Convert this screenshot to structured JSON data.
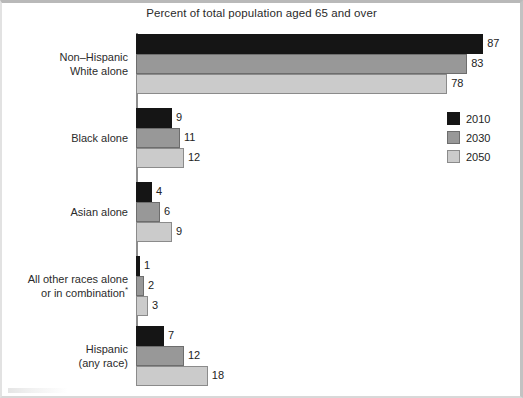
{
  "chart_data": {
    "type": "bar",
    "orientation": "horizontal",
    "title": "Percent of total population aged 65 and over",
    "xlabel": "",
    "ylabel": "",
    "xlim": [
      0,
      90
    ],
    "grid": false,
    "legend_position": "right",
    "footnote_marker": "*",
    "categories": [
      "Non–Hispanic White alone",
      "Black alone",
      "Asian alone",
      "All other races alone or in combination*",
      "Hispanic (any race)"
    ],
    "series": [
      {
        "name": "2010",
        "color": "#151515",
        "values": [
          87,
          9,
          4,
          1,
          7
        ]
      },
      {
        "name": "2030",
        "color": "#989898",
        "values": [
          83,
          11,
          6,
          2,
          12
        ]
      },
      {
        "name": "2050",
        "color": "#cbcbcb",
        "values": [
          78,
          12,
          9,
          3,
          18
        ]
      }
    ]
  },
  "title": "Percent of total population aged 65 and over",
  "legend": {
    "items": [
      {
        "label": "2010",
        "swatch": "#151515"
      },
      {
        "label": "2030",
        "swatch": "#989898"
      },
      {
        "label": "2050",
        "swatch": "#cbcbcb"
      }
    ]
  },
  "groups": [
    {
      "label_line1": "Non–Hispanic",
      "label_line2": "White alone",
      "label_note": "",
      "bars": [
        {
          "series": "2010",
          "value": "87"
        },
        {
          "series": "2030",
          "value": "83"
        },
        {
          "series": "2050",
          "value": "78"
        }
      ]
    },
    {
      "label_line1": "Black alone",
      "label_line2": "",
      "label_note": "",
      "bars": [
        {
          "series": "2010",
          "value": "9"
        },
        {
          "series": "2030",
          "value": "11"
        },
        {
          "series": "2050",
          "value": "12"
        }
      ]
    },
    {
      "label_line1": "Asian alone",
      "label_line2": "",
      "label_note": "",
      "bars": [
        {
          "series": "2010",
          "value": "4"
        },
        {
          "series": "2030",
          "value": "6"
        },
        {
          "series": "2050",
          "value": "9"
        }
      ]
    },
    {
      "label_line1": "All other races alone",
      "label_line2": "or in combination",
      "label_note": "*",
      "bars": [
        {
          "series": "2010",
          "value": "1"
        },
        {
          "series": "2030",
          "value": "2"
        },
        {
          "series": "2050",
          "value": "3"
        }
      ]
    },
    {
      "label_line1": "Hispanic",
      "label_line2": "(any race)",
      "label_note": "",
      "bars": [
        {
          "series": "2010",
          "value": "7"
        },
        {
          "series": "2030",
          "value": "12"
        },
        {
          "series": "2050",
          "value": "18"
        }
      ]
    }
  ],
  "layout": {
    "axis_x": 136,
    "px_per_unit": 3.99,
    "group_tops": [
      34,
      108,
      182,
      256,
      326
    ],
    "bar_height": 20,
    "bar_gap": 0
  }
}
